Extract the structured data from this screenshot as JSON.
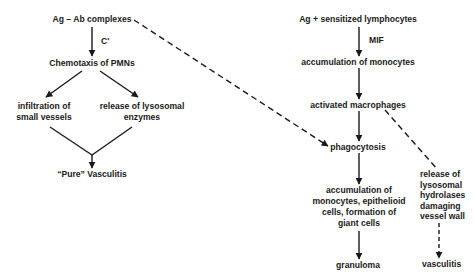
{
  "diagram": {
    "title": "",
    "left_pathway": {
      "start": "Ag – Ab complexes",
      "mediator": "C′",
      "step1": "Chemotaxis of PMNs",
      "branch_a": "infiltration of\nsmall vessels",
      "branch_b": "release of lysosomal\nenzymes",
      "outcome": "“Pure” Vasculitis"
    },
    "right_pathway": {
      "start": "Ag + sensitized lymphocytes",
      "mediator": "MIF",
      "step1": "accumulation of monocytes",
      "step2": "activated macrophages",
      "step3": "phagocytosis",
      "step4": "accumulation of\nmonocytes, epithelioid\ncells, formation of\ngiant cells",
      "outcome": "granuloma",
      "side_branch": "release of\nlysosomal\nhydrolases\ndamaging\nvessel wall",
      "side_outcome": "vasculitis"
    },
    "edges": [
      {
        "from": "Ag – Ab complexes",
        "to": "Chemotaxis of PMNs",
        "style": "solid",
        "label": "C′"
      },
      {
        "from": "Chemotaxis of PMNs",
        "to": "infiltration of small vessels",
        "style": "solid"
      },
      {
        "from": "Chemotaxis of PMNs",
        "to": "release of lysosomal enzymes",
        "style": "solid"
      },
      {
        "from": "infiltration of small vessels",
        "to": "“Pure” Vasculitis",
        "style": "solid"
      },
      {
        "from": "release of lysosomal enzymes",
        "to": "“Pure” Vasculitis",
        "style": "solid"
      },
      {
        "from": "Ag – Ab complexes",
        "to": "phagocytosis",
        "style": "dashed"
      },
      {
        "from": "Ag + sensitized lymphocytes",
        "to": "accumulation of monocytes",
        "style": "solid",
        "label": "MIF"
      },
      {
        "from": "accumulation of monocytes",
        "to": "activated macrophages",
        "style": "solid"
      },
      {
        "from": "activated macrophages",
        "to": "phagocytosis",
        "style": "solid"
      },
      {
        "from": "activated macrophages",
        "to": "release of lysosomal hydrolases damaging vessel wall",
        "style": "dashed"
      },
      {
        "from": "phagocytosis",
        "to": "accumulation of monocytes, epithelioid cells, formation of giant cells",
        "style": "solid"
      },
      {
        "from": "accumulation of monocytes, epithelioid cells, formation of giant cells",
        "to": "granuloma",
        "style": "solid"
      },
      {
        "from": "release of lysosomal hydrolases damaging vessel wall",
        "to": "vasculitis",
        "style": "dashed"
      }
    ],
    "colors": {
      "ink": "#1a1a1a",
      "background": "#ffffff"
    }
  }
}
